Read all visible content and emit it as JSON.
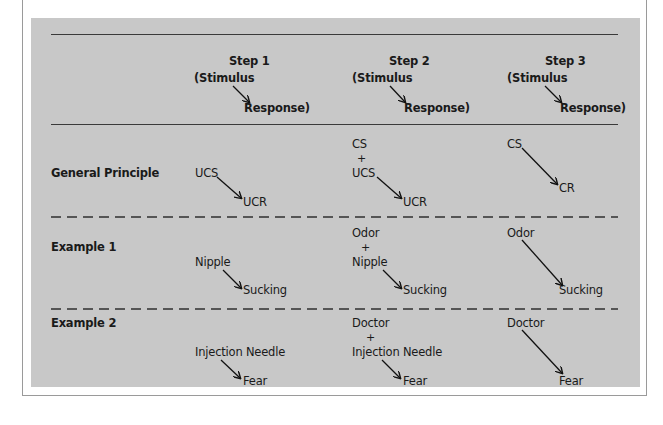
{
  "header": {
    "steps": [
      {
        "title": "Step 1",
        "stimulus": "(Stimulus",
        "response": "Response)"
      },
      {
        "title": "Step 2",
        "stimulus": "(Stimulus",
        "response": "Response)"
      },
      {
        "title": "Step 3",
        "stimulus": "(Stimulus",
        "response": "Response)"
      }
    ]
  },
  "rows": [
    {
      "label": "General Principle",
      "step1": {
        "stimulus": "UCS",
        "response": "UCR"
      },
      "step2": {
        "stimulus_a": "CS",
        "plus": "+",
        "stimulus_b": "UCS",
        "response": "UCR"
      },
      "step3": {
        "stimulus": "CS",
        "response": "CR"
      }
    },
    {
      "label": "Example 1",
      "step1": {
        "stimulus": "Nipple",
        "response": "Sucking"
      },
      "step2": {
        "stimulus_a": "Odor",
        "plus": "+",
        "stimulus_b": "Nipple",
        "response": "Sucking"
      },
      "step3": {
        "stimulus": "Odor",
        "response": "Sucking"
      }
    },
    {
      "label": "Example 2",
      "step1": {
        "stimulus": "Injection Needle",
        "response": "Fear"
      },
      "step2": {
        "stimulus_a": "Doctor",
        "plus": "+",
        "stimulus_b": "Injection Needle",
        "response": "Fear"
      },
      "step3": {
        "stimulus": "Doctor",
        "response": "Fear"
      }
    }
  ],
  "colors": {
    "panel": "#c8c8c8",
    "text": "#1a1a1a",
    "rule": "#3a3a3a"
  }
}
